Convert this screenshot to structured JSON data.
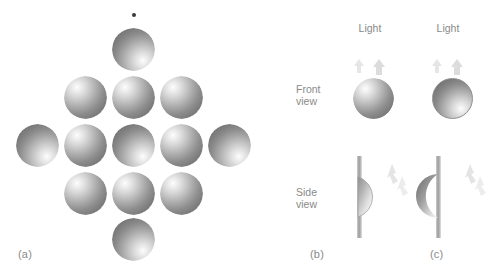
{
  "figure": {
    "type": "shape-from-shading illustration",
    "background_color": "#ffffff",
    "ink_color": "#8a8a8a"
  },
  "panels": {
    "a": {
      "label": "(a)",
      "fixation_dot": {
        "name": "fixation-dot",
        "x": 134,
        "y": 15,
        "size": 4
      },
      "sphere_diameter": 43,
      "description": "diamond array of shaded discs; convex bumps and concave dimples interleaved",
      "rows": [
        {
          "y": 50,
          "items": [
            {
              "x": 134,
              "shape": "dimple"
            }
          ]
        },
        {
          "y": 98,
          "items": [
            {
              "x": 86,
              "shape": "bump"
            },
            {
              "x": 134,
              "shape": "bump"
            },
            {
              "x": 182,
              "shape": "bump"
            }
          ]
        },
        {
          "y": 146,
          "items": [
            {
              "x": 38,
              "shape": "dimple"
            },
            {
              "x": 86,
              "shape": "bump"
            },
            {
              "x": 134,
              "shape": "dimple"
            },
            {
              "x": 182,
              "shape": "bump"
            },
            {
              "x": 230,
              "shape": "dimple"
            }
          ]
        },
        {
          "y": 194,
          "items": [
            {
              "x": 86,
              "shape": "bump"
            },
            {
              "x": 134,
              "shape": "bump"
            },
            {
              "x": 182,
              "shape": "bump"
            }
          ]
        },
        {
          "y": 240,
          "items": [
            {
              "x": 134,
              "shape": "dimple"
            }
          ]
        }
      ]
    },
    "b": {
      "label": "(b)",
      "column_heading": "Light",
      "front_view_shape": "bump",
      "side_view_shape": "convex hemisphere protruding from surface"
    },
    "c": {
      "label": "(c)",
      "column_heading": "Light",
      "front_view_shape": "dimple",
      "side_view_shape": "concave hemisphere recessed into surface"
    }
  },
  "row_labels": {
    "front": {
      "line1": "Front",
      "line2": "view"
    },
    "side": {
      "line1": "Side",
      "line2": "view"
    }
  }
}
